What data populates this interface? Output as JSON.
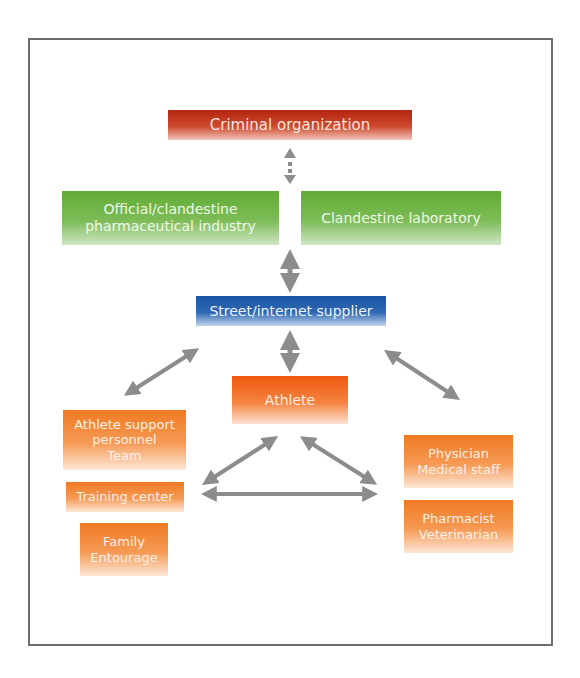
{
  "diagram": {
    "nodes": {
      "criminal": {
        "lines": [
          "Criminal organization"
        ],
        "color": "#c0321a"
      },
      "pharma_industry": {
        "lines": [
          "Official/clandestine",
          "pharmaceutical industry"
        ],
        "color": "#6bb23e"
      },
      "clandestine_lab": {
        "lines": [
          "Clandestine laboratory"
        ],
        "color": "#6bb23e"
      },
      "supplier": {
        "lines": [
          "Street/internet supplier"
        ],
        "color": "#1f5aa8"
      },
      "athlete": {
        "lines": [
          "Athlete"
        ],
        "color": "#f05a10"
      },
      "support_personnel": {
        "lines": [
          "Athlete support",
          "personnel",
          "Team"
        ],
        "color": "#f07a22"
      },
      "training_center": {
        "lines": [
          "Training center"
        ],
        "color": "#f07a22"
      },
      "family": {
        "lines": [
          "Family",
          "Entourage"
        ],
        "color": "#f07a22"
      },
      "physician": {
        "lines": [
          "Physician",
          "Medical staff"
        ],
        "color": "#f07a22"
      },
      "pharmacist": {
        "lines": [
          "Pharmacist",
          "Veterinarian"
        ],
        "color": "#f07a22"
      }
    },
    "edges": [
      {
        "from": "Criminal organization",
        "to": "Official/clandestine pharmaceutical industry / Clandestine laboratory",
        "style": "dotted",
        "direction": "both"
      },
      {
        "from": "Pharmaceutical industry / Clandestine laboratory",
        "to": "Street/internet supplier",
        "style": "solid",
        "direction": "both"
      },
      {
        "from": "Street/internet supplier",
        "to": "Athlete",
        "style": "solid",
        "direction": "both"
      },
      {
        "from": "Street/internet supplier",
        "to": "Athlete support personnel",
        "style": "solid",
        "direction": "both"
      },
      {
        "from": "Street/internet supplier",
        "to": "Physician / Medical staff",
        "style": "solid",
        "direction": "both"
      },
      {
        "from": "Athlete",
        "to": "Training center group",
        "style": "solid",
        "direction": "both"
      },
      {
        "from": "Athlete",
        "to": "Physician / Pharmacist group",
        "style": "solid",
        "direction": "both"
      },
      {
        "from": "Training center group",
        "to": "Physician / Pharmacist group",
        "style": "solid",
        "direction": "both"
      }
    ],
    "arrow_color": "#8c8c8c"
  }
}
